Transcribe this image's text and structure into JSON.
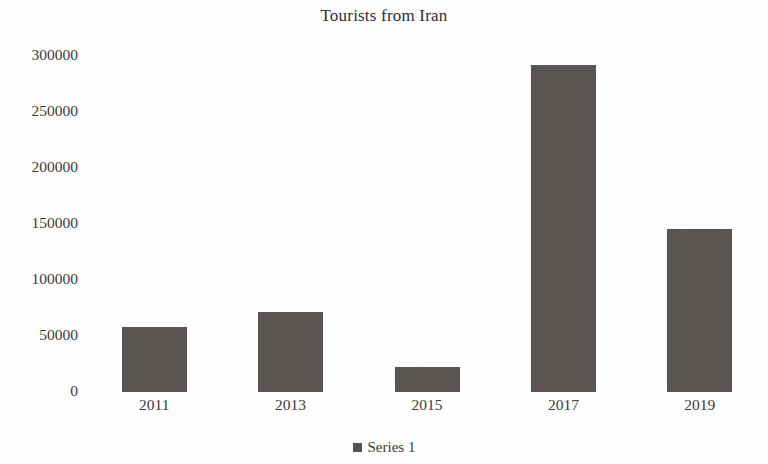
{
  "chart_data": {
    "type": "bar",
    "title": "Tourists from Iran",
    "xlabel": "",
    "ylabel": "",
    "categories": [
      "2011",
      "2013",
      "2015",
      "2017",
      "2019"
    ],
    "values": [
      57000,
      70500,
      22000,
      287000,
      143000
    ],
    "series": [
      {
        "name": "Series 1",
        "values": [
          57000,
          70500,
          22000,
          287000,
          143000
        ]
      }
    ],
    "ylim": [
      0,
      300000
    ],
    "y_ticks": [
      "300000",
      "250000",
      "200000",
      "150000",
      "100000",
      "50000",
      "0"
    ],
    "y_tick_values": [
      300000,
      250000,
      200000,
      150000,
      100000,
      50000,
      0
    ],
    "grid": false,
    "legend_position": "bottom",
    "bar_color": "#5a5552",
    "background_color": "#ffffff",
    "text_color": "#3c3c3c",
    "note": "last bar (2019) is clipped by the right edge of the image"
  },
  "legend": {
    "entries": [
      {
        "label": "Series 1",
        "color": "#585350",
        "marker": "square-marker-icon"
      }
    ]
  }
}
